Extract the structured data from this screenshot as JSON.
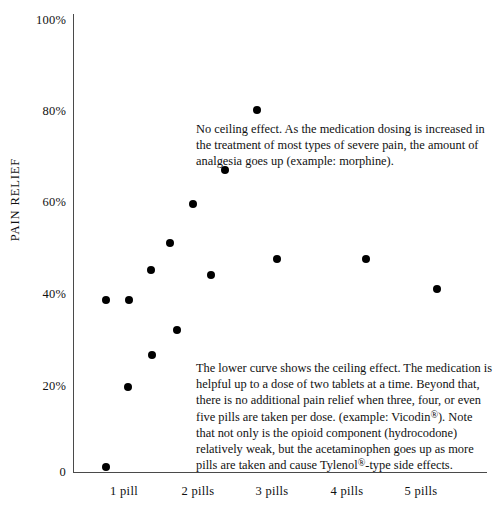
{
  "chart_data": {
    "type": "scatter",
    "title": "",
    "xlabel": "",
    "ylabel": "PAIN RELIEF",
    "xlim": [
      0,
      5.6
    ],
    "ylim": [
      0,
      100
    ],
    "grid": false,
    "legend": "none",
    "x_tick_labels": [
      "1 pill",
      "2 pills",
      "3 pills",
      "4 pills",
      "5 pills"
    ],
    "x_tick_values": [
      1,
      2,
      3,
      4,
      5
    ],
    "y_tick_labels": [
      "0",
      "20%",
      "40%",
      "60%",
      "80%",
      "100%"
    ],
    "y_tick_values": [
      0,
      20,
      40,
      60,
      80,
      100
    ],
    "series": [
      {
        "name": "No ceiling effect (opioid, e.g. morphine)",
        "points": [
          {
            "x": 0.45,
            "y": 37.5
          },
          {
            "x": 0.75,
            "y": 37.5
          },
          {
            "x": 1.06,
            "y": 44.0
          },
          {
            "x": 1.31,
            "y": 50.0
          },
          {
            "x": 1.62,
            "y": 58.5
          },
          {
            "x": 2.05,
            "y": 66.0
          },
          {
            "x": 2.48,
            "y": 79.0
          }
        ]
      },
      {
        "name": "Ceiling effect (combination opioid, e.g. Vicodin)",
        "points": [
          {
            "x": 0.45,
            "y": 1.0
          },
          {
            "x": 0.74,
            "y": 18.5
          },
          {
            "x": 1.07,
            "y": 25.5
          },
          {
            "x": 1.4,
            "y": 31.0
          },
          {
            "x": 1.87,
            "y": 43.0
          },
          {
            "x": 2.75,
            "y": 46.5
          },
          {
            "x": 3.96,
            "y": 46.5
          },
          {
            "x": 4.92,
            "y": 40.0
          }
        ]
      }
    ],
    "annotations": [
      {
        "id": "upper",
        "text": "No ceiling effect. As the medication dosing is increased in the treatment of most types of severe pain, the amount of analgesia goes up (example: morphine)."
      },
      {
        "id": "lower",
        "text_part_1": "The lower curve shows the ceiling effect. The medication is helpful up to a dose of two tablets at a time. Beyond that, there is no additional pain relief when three, four, or even five pills are taken per dose. (example: Vicodin",
        "reg_1": "®",
        "text_part_2": "). Note that not only is the opioid component (hydrocodone) relatively weak, but the acetaminophen goes up as more pills are taken and cause Tylenol",
        "reg_2": "®",
        "text_part_3": "-type side effects."
      }
    ],
    "colors": {
      "axis": "#4a4a4a",
      "point": "#000000",
      "text": "#111111",
      "background": "#ffffff"
    }
  }
}
